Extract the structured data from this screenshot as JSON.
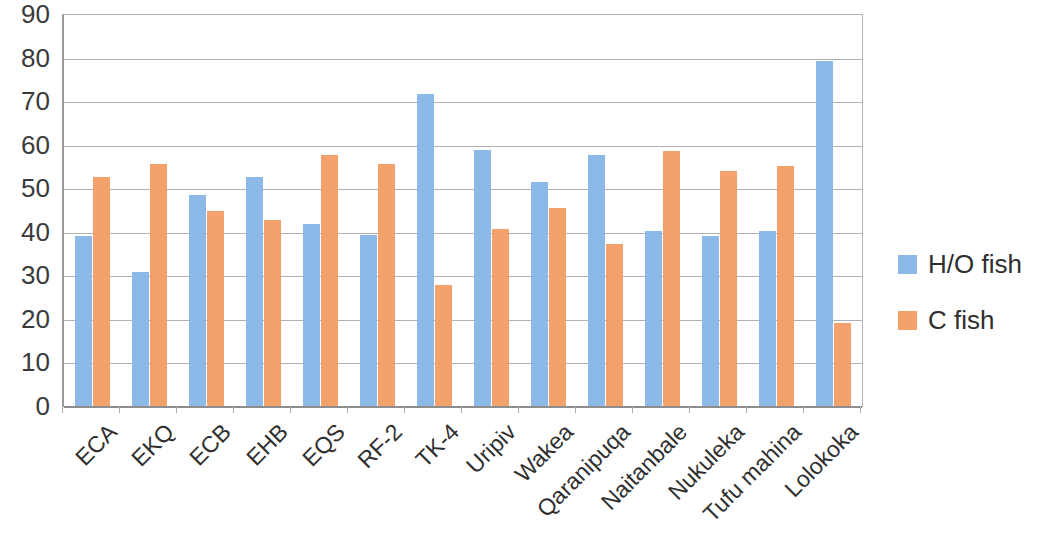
{
  "chart_data": {
    "type": "bar",
    "title": "",
    "subtitle": "",
    "xlabel": "",
    "ylabel": "",
    "ylim": [
      0,
      90
    ],
    "ytick_step": 10,
    "yticks": [
      90,
      80,
      70,
      60,
      50,
      40,
      30,
      20,
      10,
      0
    ],
    "grid": true,
    "legend_position": "right",
    "categories": [
      "ECA",
      "EKQ",
      "ECB",
      "EHB",
      "EQS",
      "RF-2",
      "TK-4",
      "Uripiv",
      "Wakea",
      "Qaranipuqa",
      "Naitanbale",
      "Nukuleka",
      "Tufu mahina",
      "Lolokoka"
    ],
    "series": [
      {
        "name": "H/O fish",
        "color": "#8CB9E8",
        "values": [
          39.2,
          31.0,
          48.7,
          52.7,
          42.0,
          39.6,
          71.8,
          59.0,
          51.7,
          57.8,
          40.4,
          39.3,
          40.3,
          79.5
        ]
      },
      {
        "name": "C fish",
        "color": "#F4A26C",
        "values": [
          52.8,
          55.8,
          45.0,
          43.0,
          57.8,
          55.8,
          27.9,
          40.8,
          45.8,
          37.5,
          58.7,
          54.3,
          55.3,
          19.3
        ]
      }
    ]
  },
  "legend": {
    "items": [
      {
        "label": "H/O fish",
        "color": "#8CB9E8"
      },
      {
        "label": "C fish",
        "color": "#F4A26C"
      }
    ]
  },
  "colors": {
    "series_ho_fish": "#8CB9E8",
    "series_c_fish": "#F4A26C",
    "gridline": "#B0B0B0",
    "axis": "#8E8E8E",
    "text": "#2E2E2E",
    "background": "#FFFFFF"
  }
}
